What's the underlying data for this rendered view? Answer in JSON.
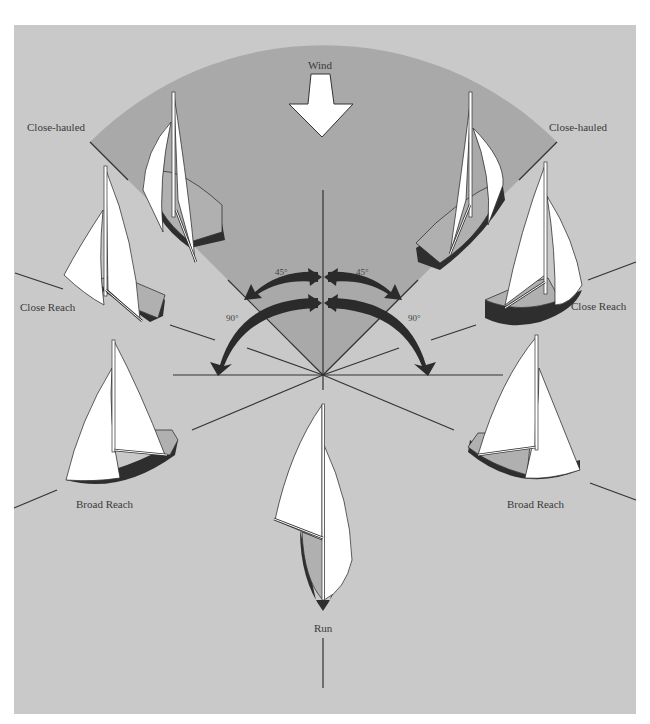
{
  "diagram": {
    "wind_label": "Wind",
    "labels": {
      "close_hauled_left": "Close-hauled",
      "close_hauled_right": "Close-hauled",
      "close_reach_left": "Close Reach",
      "close_reach_right": "Close Reach",
      "broad_reach_left": "Broad Reach",
      "broad_reach_right": "Broad Reach",
      "run": "Run"
    },
    "angles": {
      "left_45": "45°",
      "right_45": "45°",
      "left_90": "90°",
      "right_90": "90°"
    },
    "colors": {
      "page_background": "#ffffff",
      "water_background": "#c9c9c9",
      "no_go_zone": "#a9a9a9",
      "sail": "#ffffff",
      "deck": "#b0b0b0",
      "hull": "#2e2e2e",
      "arrow": "#2b2b2b",
      "line": "#333333",
      "text": "#3a3a3a"
    }
  }
}
